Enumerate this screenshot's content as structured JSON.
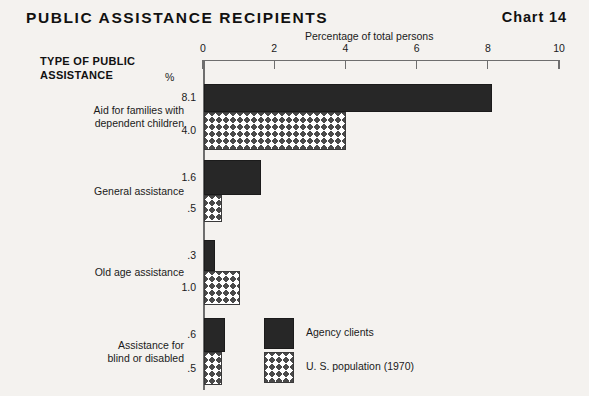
{
  "header": {
    "title": "PUBLIC ASSISTANCE RECIPIENTS",
    "chart_number": "Chart 14"
  },
  "labels": {
    "group_heading_line1": "TYPE OF PUBLIC",
    "group_heading_line2": "ASSISTANCE",
    "percent_symbol": "%"
  },
  "legend": {
    "items": [
      {
        "label": "Agency clients",
        "swatch": "solid-black"
      },
      {
        "label": "U. S. population (1970)",
        "swatch": "crosshatch"
      }
    ]
  },
  "colors": {
    "background": "#f4f2ef",
    "agency_fill": "#272727",
    "population_fill": "#ffffff",
    "population_hatch": "#4a4a4a",
    "axis": "#6e6e6e",
    "text": "#1a1a1a"
  },
  "chart_data": {
    "type": "bar",
    "orientation": "horizontal",
    "title": "PUBLIC ASSISTANCE RECIPIENTS",
    "subtitle": "Chart 14",
    "xlabel": "Percentage of total persons",
    "ylabel": "TYPE OF PUBLIC ASSISTANCE",
    "unit": "%",
    "xlim": [
      0,
      10
    ],
    "xticks": [
      0,
      2,
      4,
      6,
      8,
      10
    ],
    "xticklabels": [
      "0",
      "2",
      "4",
      "6",
      "8",
      "10"
    ],
    "grid": false,
    "legend_position": "inside-bottom-center",
    "categories": [
      "Aid for families with dependent children",
      "General assistance",
      "Old age assistance",
      "Assistance for blind or disabled"
    ],
    "category_lines": [
      [
        "Aid for families with",
        "dependent children"
      ],
      [
        "General assistance"
      ],
      [
        "Old age assistance"
      ],
      [
        "Assistance for",
        "blind or disabled"
      ]
    ],
    "series": [
      {
        "name": "Agency clients",
        "values": [
          8.1,
          1.6,
          0.3,
          0.6
        ],
        "value_labels": [
          "8.1",
          "1.6",
          ".3",
          ".6"
        ]
      },
      {
        "name": "U. S. population (1970)",
        "values": [
          4.0,
          0.5,
          1.0,
          0.5
        ],
        "value_labels": [
          "4.0",
          ".5",
          "1.0",
          ".5"
        ]
      }
    ]
  }
}
